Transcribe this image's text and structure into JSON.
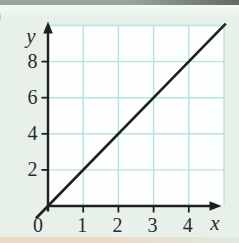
{
  "figure": {
    "problem_label_fragment": ")",
    "y_axis_label": "y",
    "x_axis_label": "x",
    "origin_label": "0",
    "y_tick_labels": [
      "2",
      "4",
      "6",
      "8"
    ],
    "x_tick_labels": [
      "1",
      "2",
      "3",
      "4"
    ]
  },
  "chart_data": {
    "type": "line",
    "title": "",
    "xlabel": "x",
    "ylabel": "y",
    "xlim": [
      0,
      5
    ],
    "ylim": [
      0,
      10
    ],
    "x_ticks": [
      1,
      2,
      3,
      4
    ],
    "y_ticks": [
      2,
      4,
      6,
      8
    ],
    "grid": true,
    "legend": false,
    "series": [
      {
        "name": "y = 2x",
        "equation": "y = 2x",
        "slope": 2,
        "intercept": 0,
        "points": [
          [
            0,
            0
          ],
          [
            5.05,
            10.1
          ]
        ]
      }
    ]
  },
  "colors": {
    "axis": "#1f1f1f",
    "line": "#1f1f1f",
    "text": "#2b2b2b",
    "grid": "#b4e3e1",
    "plot_bg": "#fdfefe",
    "page_bg": "#e8f1e9",
    "top_strip_left": "#97a59c",
    "top_strip_right": "#606c65",
    "bottom_strip_left": "#edd9c8",
    "bottom_strip_right": "#e0eadd"
  }
}
